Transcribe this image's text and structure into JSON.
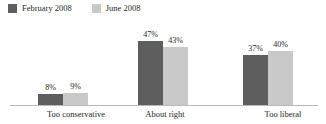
{
  "legend": {
    "items": [
      {
        "label": "February 2008",
        "color": "#5e5e5e",
        "swatch_name": "legend-swatch-february"
      },
      {
        "label": "June 2008",
        "color": "#c9c9c9",
        "swatch_name": "legend-swatch-june"
      }
    ]
  },
  "axis": {
    "baseline_color": "#b9b9b9"
  },
  "chart_data": {
    "type": "bar",
    "title": "",
    "subtitle": "",
    "xlabel": "",
    "ylabel": "",
    "ylim": [
      0,
      50
    ],
    "grid": false,
    "legend_position": "top-left",
    "categories": [
      "Too conservative",
      "About right",
      "Too liberal"
    ],
    "series": [
      {
        "name": "February 2008",
        "color": "#5e5e5e",
        "values": [
          8,
          47,
          37
        ],
        "labels": [
          "8%",
          "9%",
          "47%"
        ]
      },
      {
        "name": "June 2008",
        "color": "#c9c9c9",
        "values": [
          9,
          43,
          40
        ],
        "labels": [
          "9%",
          "43%",
          "40%"
        ]
      }
    ],
    "data_labels": [
      [
        "8%",
        "9%"
      ],
      [
        "47%",
        "43%"
      ],
      [
        "37%",
        "40%"
      ]
    ]
  },
  "groups": [
    {
      "category": "Too conservative",
      "bars": [
        {
          "series": "February 2008",
          "value": 8,
          "label": "8%",
          "color": "#5e5e5e"
        },
        {
          "series": "June 2008",
          "value": 9,
          "label": "9%",
          "color": "#c9c9c9"
        }
      ]
    },
    {
      "category": "About right",
      "bars": [
        {
          "series": "February 2008",
          "value": 47,
          "label": "47%",
          "color": "#5e5e5e"
        },
        {
          "series": "June 2008",
          "value": 43,
          "label": "43%",
          "color": "#c9c9c9"
        }
      ]
    },
    {
      "category": "Too liberal",
      "bars": [
        {
          "series": "February 2008",
          "value": 37,
          "label": "37%",
          "color": "#5e5e5e"
        },
        {
          "series": "June 2008",
          "value": 40,
          "label": "40%",
          "color": "#c9c9c9"
        }
      ]
    }
  ],
  "layout": {
    "group_left_px": [
      38,
      138,
      243
    ],
    "label_left_px": [
      26,
      140,
      247
    ],
    "label_width_px": [
      100,
      50,
      72
    ],
    "px_per_percent": 1.36
  }
}
